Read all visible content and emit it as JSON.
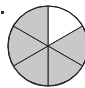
{
  "diagram": {
    "type": "fraction-circle",
    "total_parts": 6,
    "shaded_parts": 5,
    "unshaded_parts": 1,
    "unshaded_position": "top-right",
    "colors": {
      "shaded": "#c8c8c8",
      "unshaded": "#ffffff",
      "stroke": "#222222"
    }
  }
}
